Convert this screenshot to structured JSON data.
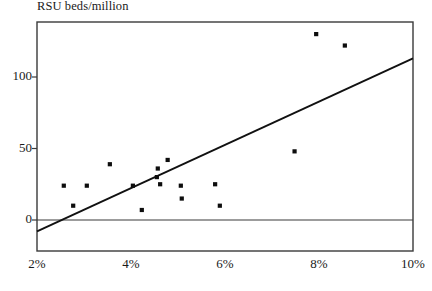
{
  "chart_data": {
    "type": "scatter",
    "title": "RSU beds/million",
    "xlabel": "",
    "ylabel": "RSU beds/million",
    "xlim": [
      2,
      10
    ],
    "ylim": [
      -22,
      138
    ],
    "grid": false,
    "legend": null,
    "x_tick_labels": [
      "2%",
      "4%",
      "6%",
      "8%",
      "10%"
    ],
    "x_ticks": [
      2,
      4,
      6,
      8,
      10
    ],
    "y_tick_labels": [
      "0",
      "50",
      "100"
    ],
    "y_ticks": [
      0,
      50,
      100
    ],
    "zero_line": 0,
    "points": [
      {
        "x": 2.57,
        "y": 24
      },
      {
        "x": 2.77,
        "y": 10
      },
      {
        "x": 3.06,
        "y": 24
      },
      {
        "x": 3.55,
        "y": 39
      },
      {
        "x": 4.04,
        "y": 24
      },
      {
        "x": 4.23,
        "y": 7
      },
      {
        "x": 4.55,
        "y": 30
      },
      {
        "x": 4.57,
        "y": 36
      },
      {
        "x": 4.62,
        "y": 25
      },
      {
        "x": 4.78,
        "y": 42
      },
      {
        "x": 5.06,
        "y": 24
      },
      {
        "x": 5.08,
        "y": 15
      },
      {
        "x": 5.79,
        "y": 25
      },
      {
        "x": 5.89,
        "y": 10
      },
      {
        "x": 7.48,
        "y": 48
      },
      {
        "x": 7.94,
        "y": 130
      },
      {
        "x": 8.55,
        "y": 122
      }
    ],
    "trend_line": {
      "x1": 2,
      "y1": -8,
      "x2": 10,
      "y2": 113,
      "label": "linear fit"
    }
  }
}
